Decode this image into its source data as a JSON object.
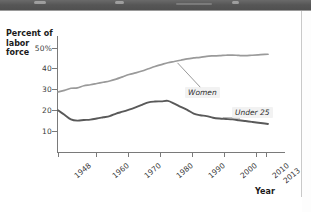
{
  "page": {
    "header_band_color": "#585858",
    "background": "#ffffff"
  },
  "chart_data": {
    "type": "line",
    "title": "",
    "xlabel": "Year",
    "ylabel": "Percent of labor force",
    "ylabel_line1": "Percent of",
    "ylabel_line2": "labor force",
    "ylim": [
      0,
      55
    ],
    "xlim": [
      1948,
      2013
    ],
    "grid": false,
    "legend_position": "inline-annotations",
    "ytick_labels": [
      "50%",
      "40",
      "30",
      "20",
      "10"
    ],
    "ytick_values": [
      50,
      40,
      30,
      20,
      10
    ],
    "xtick_labels": [
      "1948",
      "1960",
      "1970",
      "1980",
      "1990",
      "2000",
      "2010",
      "2013"
    ],
    "xtick_values": [
      1948,
      1960,
      1970,
      1980,
      1990,
      2000,
      2010,
      2013
    ],
    "series": [
      {
        "name": "Women",
        "label": "Women",
        "color": "#9a9a9a",
        "x": [
          1948,
          1950,
          1952,
          1954,
          1956,
          1958,
          1960,
          1962,
          1964,
          1966,
          1968,
          1970,
          1972,
          1974,
          1976,
          1978,
          1980,
          1982,
          1984,
          1986,
          1988,
          1990,
          1992,
          1994,
          1996,
          1998,
          2000,
          2002,
          2004,
          2006,
          2008,
          2010,
          2012,
          2013
        ],
        "values": [
          28.8,
          29.6,
          30.6,
          30.8,
          31.8,
          32.3,
          32.9,
          33.5,
          34.1,
          35.0,
          36.1,
          37.2,
          38.0,
          38.9,
          40.0,
          41.1,
          42.0,
          42.9,
          43.5,
          44.1,
          44.8,
          45.2,
          45.5,
          46.0,
          46.2,
          46.3,
          46.5,
          46.6,
          46.4,
          46.3,
          46.5,
          46.7,
          46.9,
          47.0
        ]
      },
      {
        "name": "Under 25",
        "label": "Under 25",
        "color": "#595959",
        "x": [
          1948,
          1950,
          1952,
          1954,
          1956,
          1958,
          1960,
          1962,
          1964,
          1966,
          1968,
          1970,
          1972,
          1974,
          1976,
          1978,
          1980,
          1982,
          1984,
          1986,
          1988,
          1990,
          1992,
          1994,
          1996,
          1998,
          2000,
          2002,
          2004,
          2006,
          2008,
          2010,
          2012,
          2013
        ],
        "values": [
          20.0,
          17.8,
          15.6,
          15.0,
          15.3,
          15.5,
          16.0,
          16.6,
          17.2,
          18.4,
          19.3,
          20.3,
          21.4,
          22.6,
          23.8,
          24.2,
          24.3,
          24.5,
          23.2,
          21.6,
          20.2,
          18.4,
          17.6,
          17.2,
          16.4,
          16.0,
          15.8,
          15.6,
          15.2,
          14.8,
          14.4,
          14.0,
          13.6,
          13.4
        ]
      }
    ],
    "annotations": [
      {
        "text": "Women",
        "series": "Women",
        "at_x": 1985,
        "label_x": 185,
        "label_y": 76
      },
      {
        "text": "Under 25",
        "series": "Under 25",
        "at_x": 1999,
        "label_x": 232,
        "label_y": 96
      }
    ]
  }
}
